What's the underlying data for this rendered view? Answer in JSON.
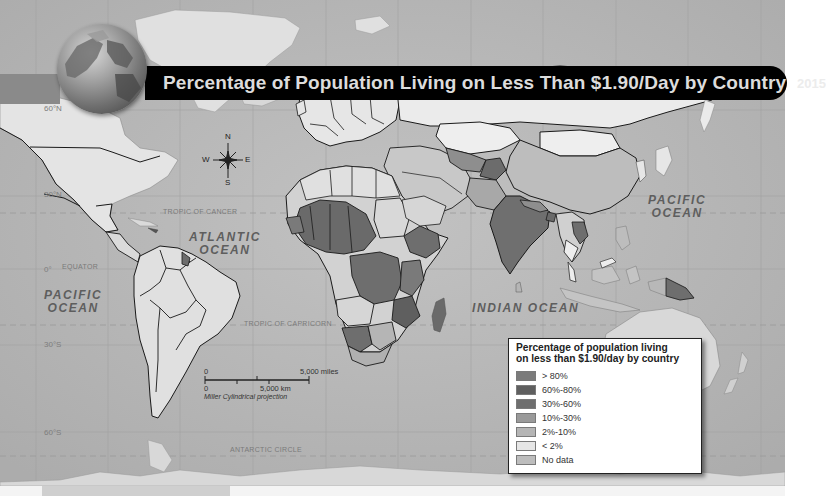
{
  "title": {
    "text": "Percentage of Population Living on Less Than $1.90/Day by Country",
    "year": "2015"
  },
  "compass": {
    "n": "N",
    "s": "S",
    "e": "E",
    "w": "W",
    "icon": "compass-rose-icon"
  },
  "latitude_labels": {
    "lat60n": "60°N",
    "lat30n": "30°N",
    "lat0": "0°",
    "lat30s": "30°S",
    "lat60s": "60°S"
  },
  "line_labels": {
    "arctic": "ARCTIC CIRCLE",
    "cancer": "TROPIC OF CANCER",
    "equator": "EQUATOR",
    "capricorn": "TROPIC OF CAPRICORN",
    "antarctic": "ANTARCTIC CIRCLE"
  },
  "oceans": {
    "atlantic_1": "ATLANTIC",
    "atlantic_2": "OCEAN",
    "pacific_w_1": "PACIFIC",
    "pacific_w_2": "OCEAN",
    "pacific_e_1": "PACIFIC",
    "pacific_e_2": "OCEAN",
    "indian": "INDIAN OCEAN"
  },
  "scale_bar": {
    "miles_zero": "0",
    "miles_max": "5,000 miles",
    "km_zero": "0",
    "km_max": "5,000 km",
    "projection": "Miller Cylindrical projection"
  },
  "legend": {
    "title_line1": "Percentage of population living",
    "title_line2": "on less than $1.90/day by country",
    "items": [
      {
        "label": "> 80%",
        "color": "#7b7b7b"
      },
      {
        "label": "60%-80%",
        "color": "#5f5f5f"
      },
      {
        "label": "30%-60%",
        "color": "#6e6e6e"
      },
      {
        "label": "10%-30%",
        "color": "#9a9a9a"
      },
      {
        "label": "2%-10%",
        "color": "#b5b5b5"
      },
      {
        "label": "< 2%",
        "color": "#e6e6e6"
      },
      {
        "label": "No data",
        "color": "#bdbdbd"
      }
    ]
  },
  "colors": {
    "ocean": "#b9b9b9",
    "land_default": "#e2e2e2",
    "banner": "#000000",
    "border": "#1a1a1a"
  }
}
